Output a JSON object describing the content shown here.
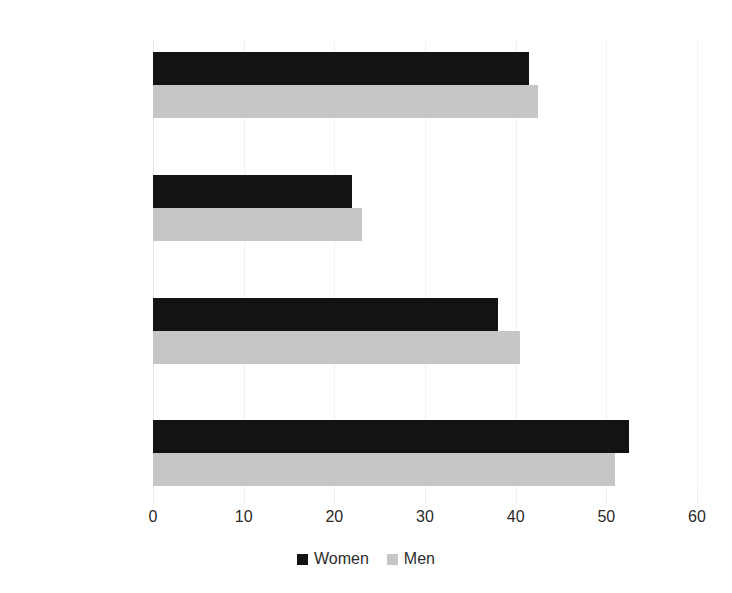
{
  "chart_data": {
    "type": "bar",
    "orientation": "horizontal",
    "title": "",
    "subtitle": "",
    "xlabel": "",
    "ylabel": "",
    "xlim": [
      0,
      60
    ],
    "xticks": [
      0,
      10,
      20,
      30,
      40,
      50,
      60
    ],
    "xtick_labels": [
      "0",
      "10",
      "20",
      "30",
      "40",
      "50",
      "60"
    ],
    "categories": [
      "Religion",
      "Health Related",
      "Social Services",
      "Other Nonprofits"
    ],
    "series": [
      {
        "name": "Women",
        "color": "#131313",
        "values": [
          41.5,
          22.0,
          38.0,
          52.5
        ]
      },
      {
        "name": "Men",
        "color": "#c6c6c6",
        "values": [
          42.5,
          23.0,
          40.5,
          51.0
        ]
      }
    ],
    "legend": {
      "position": "bottom",
      "entries": [
        {
          "label": "Women",
          "color": "#131313"
        },
        {
          "label": "Men",
          "color": "#c6c6c6"
        }
      ]
    },
    "grid": {
      "vertical": true,
      "horizontal": false,
      "color": "#f2f2f2"
    },
    "background": "#ffffff"
  }
}
